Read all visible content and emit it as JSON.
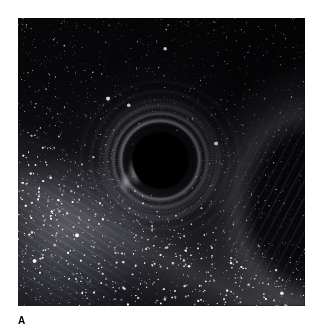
{
  "figure": {
    "panel_label": "A",
    "caption_text": "",
    "background_color": "#ffffff",
    "image": {
      "alt_description": "Simulated view of a black hole silhouetted against the Milky Way star field, showing gravitational lensing arcs",
      "frame": {
        "x": 18,
        "y": 18,
        "width": 287,
        "height": 288
      },
      "sky_color_dark": "#050507",
      "sky_color_mid": "#131318",
      "sky_color_light": "#24242c",
      "shadow_color": "#000000",
      "arc_color": "#dee0e8",
      "star_color": "#ffffff",
      "features": [
        {
          "name": "black-hole-shadow",
          "cx_pct": 49.5,
          "cy_pct": 49.3,
          "r_pct": 9.6
        },
        {
          "name": "photon-ring-arcs",
          "inner_r_pct": 18.0,
          "outer_r_pct": 40.0
        },
        {
          "name": "milky-way-band",
          "angle_deg": 27
        },
        {
          "name": "lensed-knot-left",
          "cx_pct": 41.3,
          "cy_pct": 53.0
        },
        {
          "name": "dust-streaks-lower-left"
        },
        {
          "name": "dust-streaks-right-arc"
        },
        {
          "name": "starfield"
        }
      ]
    }
  }
}
